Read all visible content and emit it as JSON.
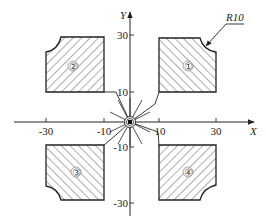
{
  "diagram": {
    "title": "",
    "axes": {
      "x_label": "X",
      "y_label": "Y",
      "x_ticks": [
        {
          "value": -30,
          "label": "-30"
        },
        {
          "value": -10,
          "label": "-10"
        },
        {
          "value": 10,
          "label": "10"
        },
        {
          "value": 30,
          "label": "30"
        }
      ],
      "y_ticks": [
        {
          "value": 30,
          "label": "30"
        },
        {
          "value": 10,
          "label": "10"
        },
        {
          "value": -10,
          "label": "-10"
        },
        {
          "value": -30,
          "label": "-30"
        }
      ]
    },
    "annotation": {
      "radius_label": "R10"
    },
    "parts": [
      {
        "id": "1",
        "label": "①",
        "quadrant": "top-right",
        "x_range": [
          10,
          30
        ],
        "y_range": [
          10,
          30
        ],
        "notch_corner": "top-right"
      },
      {
        "id": "2",
        "label": "②",
        "quadrant": "top-left",
        "x_range": [
          -30,
          -10
        ],
        "y_range": [
          10,
          30
        ],
        "notch_corner": "top-left"
      },
      {
        "id": "3",
        "label": "③",
        "quadrant": "bottom-left",
        "x_range": [
          -30,
          -10
        ],
        "y_range": [
          -30,
          -10
        ],
        "notch_corner": "bottom-left"
      },
      {
        "id": "4",
        "label": "④",
        "quadrant": "bottom-right",
        "x_range": [
          10,
          30
        ],
        "y_range": [
          -30,
          -10
        ],
        "notch_corner": "bottom-right"
      }
    ],
    "colors": {
      "line": "#222222",
      "hatch": "#333333",
      "background": "#ffffff"
    }
  }
}
